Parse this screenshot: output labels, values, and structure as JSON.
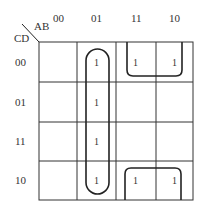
{
  "kmap": {
    "row_var": "CD",
    "col_var": "AB",
    "col_labels": [
      "00",
      "01",
      "11",
      "10"
    ],
    "row_labels": [
      "00",
      "01",
      "11",
      "10"
    ],
    "cells": [
      [
        "",
        "1",
        "1",
        "1"
      ],
      [
        "",
        "1",
        "",
        ""
      ],
      [
        "",
        "1",
        "",
        ""
      ],
      [
        "",
        "1",
        "1",
        "1"
      ]
    ],
    "groups": [
      {
        "name": "column-01-group",
        "cells": "AB=01, all CD"
      },
      {
        "name": "top-right-group",
        "cells": "CD=00, AB=11,10"
      },
      {
        "name": "bottom-right-group",
        "cells": "CD=10, AB=11,10"
      }
    ]
  }
}
